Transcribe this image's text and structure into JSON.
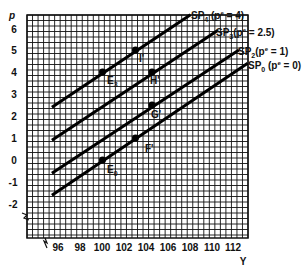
{
  "chart_data": {
    "type": "line",
    "title": "",
    "xlabel": "Y",
    "ylabel": "p",
    "xlim": [
      94.5,
      114.5
    ],
    "ylim": [
      -3.5,
      6.5
    ],
    "grid": true,
    "x_ticks": [
      96,
      98,
      100,
      102,
      104,
      106,
      108,
      110,
      112
    ],
    "y_ticks": [
      6,
      5,
      4,
      3,
      2,
      1,
      0,
      -1,
      -2
    ],
    "series": [
      {
        "name": "SP4",
        "sub": "4",
        "label_suffix": " (pe = 4)",
        "expected_p": 4,
        "x": [
          95.4,
          108
        ],
        "y": [
          2.4,
          6.6
        ]
      },
      {
        "name": "SP3",
        "sub": "3",
        "label_suffix": " (pe = 2.5)",
        "expected_p": 2.5,
        "x": [
          95.4,
          110.5
        ],
        "y": [
          0.9,
          5.9
        ]
      },
      {
        "name": "SP2",
        "sub": "2",
        "label_suffix": " (pe = 1)",
        "expected_p": 1,
        "x": [
          95.4,
          112.4
        ],
        "y": [
          -0.6,
          5.0
        ]
      },
      {
        "name": "SP0",
        "sub": "0",
        "label_suffix": " (pe = 0)",
        "expected_p": 0,
        "x": [
          95.4,
          113.2
        ],
        "y": [
          -1.6,
          4.4
        ]
      }
    ],
    "points": [
      {
        "label": "E",
        "sub": "3",
        "x": 100,
        "y": 4
      },
      {
        "label": "I'",
        "sub": "",
        "x": 103,
        "y": 5
      },
      {
        "label": "H'",
        "sub": "",
        "x": 104.5,
        "y": 4
      },
      {
        "label": "G'",
        "sub": "",
        "x": 104.5,
        "y": 2.5
      },
      {
        "label": "F'",
        "sub": "",
        "x": 103,
        "y": 1
      },
      {
        "label": "E",
        "sub": "0",
        "x": 100,
        "y": 0
      }
    ],
    "annotations": [
      "axis break on y-axis below -2",
      "axis break on x-axis before 96"
    ]
  },
  "axes": {
    "x_title": "Y",
    "y_title": "p"
  },
  "curve_labels": {
    "sp4": {
      "base": "SP",
      "sub": "4",
      "open": " (p",
      "sup": "e",
      "rest": " = 4)"
    },
    "sp3": {
      "base": "SP",
      "sub": "3",
      "open": "(p",
      "sup": "e",
      "rest": " = 2.5)"
    },
    "sp2": {
      "base": "SP",
      "sub": "2",
      "open": "(p",
      "sup": "e",
      "rest": " = 1)"
    },
    "sp0": {
      "base": "SP",
      "sub": "0",
      "open": " (p",
      "sup": "e",
      "rest": " = 0)"
    }
  },
  "point_labels": {
    "e3": {
      "base": "E",
      "sub": "3"
    },
    "i": {
      "base": "I'"
    },
    "h": {
      "base": "H'"
    },
    "g": {
      "base": "G'"
    },
    "f": {
      "base": "F'"
    },
    "e0": {
      "base": "E",
      "sub": "0"
    }
  },
  "tick_labels": {
    "x": [
      "96",
      "98",
      "100",
      "102",
      "104",
      "106",
      "108",
      "110",
      "112"
    ],
    "y": [
      "6",
      "5",
      "4",
      "3",
      "2",
      "1",
      "0",
      "-1",
      "-2"
    ]
  }
}
